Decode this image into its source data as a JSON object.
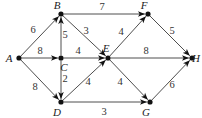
{
  "diagram": {
    "type": "weighted-directed-graph",
    "nodes": [
      {
        "id": "A",
        "label": "A",
        "x": 19,
        "y": 58,
        "lx": 9,
        "ly": 62
      },
      {
        "id": "B",
        "label": "B",
        "x": 61,
        "y": 14,
        "lx": 57,
        "ly": 9
      },
      {
        "id": "C",
        "label": "C",
        "x": 61,
        "y": 58,
        "lx": 64,
        "ly": 71
      },
      {
        "id": "D",
        "label": "D",
        "x": 61,
        "y": 102,
        "lx": 57,
        "ly": 116
      },
      {
        "id": "E",
        "label": "E",
        "x": 108,
        "y": 58,
        "lx": 106,
        "ly": 52
      },
      {
        "id": "F",
        "label": "F",
        "x": 148,
        "y": 14,
        "lx": 144,
        "ly": 9
      },
      {
        "id": "G",
        "label": "G",
        "x": 150,
        "y": 102,
        "lx": 146,
        "ly": 116
      },
      {
        "id": "H",
        "label": "H",
        "x": 192,
        "y": 58,
        "lx": 196,
        "ly": 62
      }
    ],
    "edges": [
      {
        "from": "A",
        "to": "B",
        "weight": "6",
        "wx": 33,
        "wy": 33
      },
      {
        "from": "A",
        "to": "C",
        "weight": "8",
        "wx": 40,
        "wy": 54
      },
      {
        "from": "A",
        "to": "D",
        "weight": "8",
        "wx": 35,
        "wy": 90
      },
      {
        "from": "C",
        "to": "B",
        "weight": "5",
        "wx": 65,
        "wy": 38
      },
      {
        "from": "C",
        "to": "D",
        "weight": "2",
        "wx": 65,
        "wy": 82
      },
      {
        "from": "C",
        "to": "E",
        "weight": "4",
        "wx": 78,
        "wy": 54
      },
      {
        "from": "B",
        "to": "E",
        "weight": "3",
        "wx": 86,
        "wy": 34
      },
      {
        "from": "B",
        "to": "F",
        "weight": "7",
        "wx": 102,
        "wy": 10
      },
      {
        "from": "D",
        "to": "E",
        "weight": "4",
        "wx": 88,
        "wy": 85
      },
      {
        "from": "D",
        "to": "G",
        "weight": "3",
        "wx": 104,
        "wy": 115
      },
      {
        "from": "E",
        "to": "F",
        "weight": "4",
        "wx": 121,
        "wy": 35
      },
      {
        "from": "E",
        "to": "H",
        "weight": "8",
        "wx": 146,
        "wy": 54
      },
      {
        "from": "E",
        "to": "G",
        "weight": "4",
        "wx": 120,
        "wy": 85
      },
      {
        "from": "F",
        "to": "H",
        "weight": "5",
        "wx": 172,
        "wy": 34
      },
      {
        "from": "G",
        "to": "H",
        "weight": "6",
        "wx": 172,
        "wy": 88
      }
    ]
  }
}
